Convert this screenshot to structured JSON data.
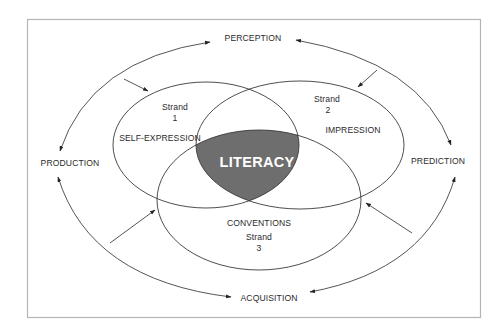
{
  "diagram": {
    "type": "venn-with-cycle",
    "center_label": "LITERACY",
    "strands": [
      {
        "id": 1,
        "strand_label": "Strand",
        "strand_number": "1",
        "name": "SELF-EXPRESSION"
      },
      {
        "id": 2,
        "strand_label": "Strand",
        "strand_number": "2",
        "name": "IMPRESSION"
      },
      {
        "id": 3,
        "strand_label": "Strand",
        "strand_number": "3",
        "name": "CONVENTIONS"
      }
    ],
    "cycle": {
      "top": "PERCEPTION",
      "right": "PREDICTION",
      "bottom": "ACQUISITION",
      "left": "PRODUCTION"
    },
    "colors": {
      "intersection_fill": "#6e6e6e",
      "line": "#3a3a3a",
      "frame": "#b5b5b5",
      "background": "#ffffff"
    }
  }
}
